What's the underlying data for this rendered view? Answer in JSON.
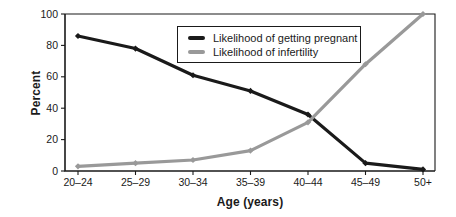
{
  "figure": {
    "background": "#ffffff",
    "text_color": "#1a1a1a"
  },
  "chart_data": {
    "type": "line",
    "title": "",
    "xlabel": "Age (years)",
    "ylabel": "Percent",
    "categories": [
      "20–24",
      "25–29",
      "30–34",
      "35–39",
      "40–44",
      "45–49",
      "50+"
    ],
    "y_ticks": [
      0,
      20,
      40,
      60,
      80,
      100
    ],
    "ylim": [
      0,
      100
    ],
    "grid": false,
    "legend_position": "top-center-inside",
    "series": [
      {
        "name": "Likelihood of getting pregnant",
        "color": "#1a1a1a",
        "marker": "diamond",
        "values": [
          86,
          78,
          61,
          51,
          36,
          5,
          1
        ]
      },
      {
        "name": "Likelihood of infertility",
        "color": "#999999",
        "marker": "diamond",
        "values": [
          3,
          5,
          7,
          13,
          31,
          68,
          100
        ]
      }
    ]
  }
}
